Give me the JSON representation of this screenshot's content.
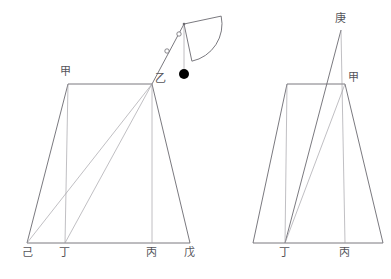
{
  "document": {
    "title": "量天尺測量圖",
    "background_color": "#ffffff",
    "stroke_color": "#6b6a70",
    "light_stroke_color": "#9d9ca2",
    "label_color": "#55545a",
    "plumb_bob_color": "#000000",
    "width": 391,
    "height": 279
  },
  "labels": {
    "left_figure": {
      "jia": "甲",
      "yi": "乙",
      "ji": "己",
      "ding": "丁",
      "bing": "丙",
      "wu": "戊"
    },
    "right_figure": {
      "geng": "庚",
      "jia": "甲",
      "ding": "丁",
      "bing": "丙"
    }
  },
  "geometry": {
    "left_figure": {
      "points": {
        "jia": [
          68,
          84
        ],
        "yi": [
          152,
          84
        ],
        "ji": [
          27,
          243
        ],
        "ding": [
          65,
          243
        ],
        "bing": [
          152,
          243
        ],
        "wu": [
          190,
          243
        ]
      },
      "edges": [
        {
          "name": "top-jia-yi",
          "from": "jia",
          "to": "yi",
          "weight": "dark"
        },
        {
          "name": "left-jia-ji",
          "from": "jia",
          "to": "ji",
          "weight": "dark"
        },
        {
          "name": "right-yi-wu",
          "from": "yi",
          "to": "wu",
          "weight": "dark"
        },
        {
          "name": "base-ji-wu",
          "from": "ji",
          "to": "wu",
          "weight": "dark"
        },
        {
          "name": "vertical-jia-ding",
          "from": "jia",
          "to": "ding",
          "weight": "light"
        },
        {
          "name": "vertical-yi-bing",
          "from": "yi",
          "to": "bing",
          "weight": "light"
        },
        {
          "name": "diagonal-yi-ji",
          "from": "yi",
          "to": "ji",
          "weight": "light"
        },
        {
          "name": "diagonal-yi-ding",
          "from": "yi",
          "to": "ding",
          "weight": "light"
        }
      ]
    },
    "right_figure": {
      "points": {
        "geng": [
          341,
          30
        ],
        "jia": [
          345,
          84
        ],
        "top_left": [
          287,
          84
        ],
        "ji": [
          253,
          243
        ],
        "ding": [
          285,
          243
        ],
        "bing": [
          345,
          243
        ],
        "wu": [
          383,
          243
        ]
      },
      "edges": [
        {
          "name": "top-left-jia",
          "from": "top_left",
          "to": "jia",
          "weight": "dark"
        },
        {
          "name": "left-topleft-ji",
          "from": "top_left",
          "to": "ji",
          "weight": "dark"
        },
        {
          "name": "base-ji-wu",
          "from": "ji",
          "to": "wu",
          "weight": "dark"
        },
        {
          "name": "right-jia-wu",
          "from": "jia",
          "to": "wu",
          "weight": "dark"
        },
        {
          "name": "apex-geng-ding",
          "from": "geng",
          "to": "ding",
          "weight": "dark"
        },
        {
          "name": "apex-geng-bing",
          "from": "geng",
          "to": "bing",
          "weight": "light"
        },
        {
          "name": "vertical-topleft-ding",
          "from": "top_left",
          "to": "ding",
          "weight": "light"
        },
        {
          "name": "diagonal-jia-ding",
          "from": "jia",
          "to": "ding",
          "weight": "light"
        }
      ]
    },
    "instrument": {
      "name": "quadrant-with-plumb-line",
      "apex": [
        184,
        24
      ],
      "sight_line_from": [
        152,
        84
      ],
      "sight_line_to": [
        184,
        24
      ],
      "sight_vanes": [
        [
          167,
          51
        ],
        [
          179,
          34
        ]
      ],
      "arc_radius": 38,
      "plumb_line_to": [
        184,
        72
      ],
      "plumb_bob_center": [
        184,
        74
      ],
      "plumb_bob_radius": 5
    }
  },
  "label_positions": {
    "left_jia": [
      60,
      66
    ],
    "left_yi": [
      155,
      73
    ],
    "left_ji": [
      22,
      247
    ],
    "left_ding": [
      59,
      247
    ],
    "left_bing": [
      146,
      247
    ],
    "left_wu": [
      184,
      247
    ],
    "right_geng": [
      335,
      13
    ],
    "right_jia": [
      348,
      72
    ],
    "right_ding": [
      279,
      247
    ],
    "right_bing": [
      339,
      247
    ]
  }
}
